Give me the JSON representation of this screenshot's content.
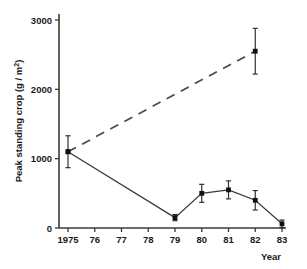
{
  "chart_data": {
    "type": "line",
    "title": "",
    "xlabel": "Year",
    "ylabel": "Peak standing crop (g / m²)",
    "ylabel_parts": {
      "main": "Peak standing crop (g / m",
      "sup": "2",
      "tail": ")"
    },
    "xlim": [
      1975,
      1983
    ],
    "ylim": [
      0,
      3000
    ],
    "grid": false,
    "legend": "none",
    "x": [
      1975,
      1976,
      1977,
      1978,
      1979,
      1980,
      1981,
      1982,
      1983
    ],
    "xtick_labels": [
      "1975",
      "76",
      "77",
      "78",
      "79",
      "80",
      "81",
      "82",
      "83"
    ],
    "ytick_values": [
      0,
      1000,
      2000,
      3000
    ],
    "ytick_labels": [
      "0",
      "1000",
      "2000",
      "3000"
    ],
    "series": [
      {
        "name": "solid-declining",
        "style": "solid",
        "marker": "square",
        "x": [
          1975,
          1979,
          1980,
          1981,
          1982,
          1983
        ],
        "values": [
          1100,
          150,
          500,
          550,
          400,
          60
        ],
        "errors": [
          230,
          45,
          130,
          130,
          140,
          55
        ]
      },
      {
        "name": "dashed-increasing",
        "style": "dashed",
        "marker": "square",
        "x": [
          1975,
          1982
        ],
        "values": [
          1100,
          2550
        ],
        "errors": [
          0,
          330
        ]
      }
    ],
    "colors": {
      "axis": "#3a3a3a",
      "solid_series": "#3a3a3a",
      "dashed_series": "#4a4a4a",
      "marker": "#111111",
      "background": "#ffffff"
    }
  }
}
